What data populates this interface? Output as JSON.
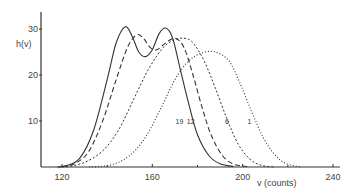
{
  "chart_data": {
    "type": "line",
    "title": "",
    "xlabel": "v  (counts)",
    "ylabel": "h(v)",
    "xlim": [
      111,
      242
    ],
    "ylim": [
      0,
      33
    ],
    "xticks": [
      120,
      160,
      200,
      240
    ],
    "xticks_minor": [
      140,
      180,
      220
    ],
    "yticks": [
      10,
      20,
      30
    ],
    "grid": false,
    "legend": "inline labels near curves",
    "series": [
      {
        "name": "19",
        "style": "solid",
        "points": [
          [
            118,
            0
          ],
          [
            122,
            0.3
          ],
          [
            128,
            2
          ],
          [
            134,
            8
          ],
          [
            140,
            19
          ],
          [
            144,
            27
          ],
          [
            148,
            30.5
          ],
          [
            151,
            28.5
          ],
          [
            154,
            25
          ],
          [
            157,
            24
          ],
          [
            160,
            25.5
          ],
          [
            163,
            29
          ],
          [
            166,
            30.2
          ],
          [
            169,
            28
          ],
          [
            172,
            22
          ],
          [
            176,
            14
          ],
          [
            180,
            7
          ],
          [
            185,
            2.5
          ],
          [
            190,
            0.7
          ],
          [
            196,
            0.1
          ]
        ]
      },
      {
        "name": "12",
        "style": "dashed",
        "points": [
          [
            120,
            0
          ],
          [
            126,
            0.8
          ],
          [
            132,
            3.5
          ],
          [
            138,
            10
          ],
          [
            144,
            19
          ],
          [
            149,
            26
          ],
          [
            153,
            28.7
          ],
          [
            156,
            28
          ],
          [
            159,
            26
          ],
          [
            162,
            25.5
          ],
          [
            166,
            27
          ],
          [
            170,
            28
          ],
          [
            174,
            26
          ],
          [
            178,
            20
          ],
          [
            182,
            13
          ],
          [
            186,
            7
          ],
          [
            191,
            2.5
          ],
          [
            196,
            0.6
          ],
          [
            202,
            0.1
          ]
        ]
      },
      {
        "name": "6",
        "style": "dash-dot",
        "points": [
          [
            122,
            0
          ],
          [
            130,
            1
          ],
          [
            138,
            3.5
          ],
          [
            145,
            8
          ],
          [
            152,
            15
          ],
          [
            158,
            21
          ],
          [
            164,
            25.5
          ],
          [
            169,
            27.5
          ],
          [
            174,
            28
          ],
          [
            178,
            27
          ],
          [
            183,
            23
          ],
          [
            188,
            17
          ],
          [
            193,
            10.5
          ],
          [
            198,
            5
          ],
          [
            203,
            1.8
          ],
          [
            208,
            0.4
          ],
          [
            214,
            0
          ]
        ]
      },
      {
        "name": "1",
        "style": "dotted",
        "points": [
          [
            132,
            0
          ],
          [
            142,
            0.5
          ],
          [
            150,
            2.5
          ],
          [
            157,
            6.5
          ],
          [
            164,
            13
          ],
          [
            170,
            19
          ],
          [
            176,
            23
          ],
          [
            182,
            24.8
          ],
          [
            188,
            25
          ],
          [
            194,
            23
          ],
          [
            199,
            18
          ],
          [
            204,
            12
          ],
          [
            209,
            6.5
          ],
          [
            214,
            2.8
          ],
          [
            219,
            0.8
          ],
          [
            226,
            0
          ]
        ]
      }
    ],
    "curve_labels": [
      {
        "text": "19",
        "x": 172,
        "y": 10
      },
      {
        "text": "12",
        "x": 177,
        "y": 10
      },
      {
        "text": "6",
        "x": 193,
        "y": 10
      },
      {
        "text": "1",
        "x": 203,
        "y": 10
      }
    ]
  }
}
